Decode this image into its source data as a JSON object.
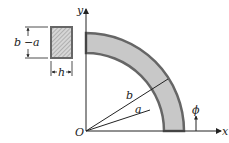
{
  "diagram": {
    "colors": {
      "ring_fill": "#c8c8c8",
      "ring_stroke": "#666666",
      "line": "#222222",
      "section_fill": "#d0d0d0"
    },
    "labels": {
      "y_axis": "y",
      "x_axis": "x",
      "origin": "O",
      "outer_radius": "b",
      "inner_radius": "a",
      "angle": "ϕ",
      "section_height_b": "b",
      "section_height_dash": "−",
      "section_height_a": "a",
      "section_width": "h"
    }
  }
}
